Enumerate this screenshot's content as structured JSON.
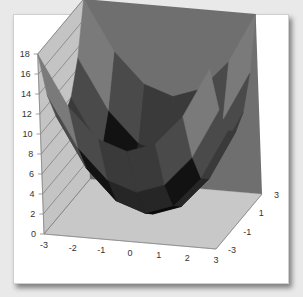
{
  "chart_data": {
    "type": "surface",
    "title": "",
    "function": "z = x^2 + y^2",
    "x": [
      -3,
      -2,
      -1,
      0,
      1,
      2,
      3
    ],
    "y": [
      -3,
      -2,
      -1,
      0,
      1,
      2,
      3
    ],
    "z": [
      [
        18,
        13,
        10,
        9,
        10,
        13,
        18
      ],
      [
        13,
        8,
        5,
        4,
        5,
        8,
        13
      ],
      [
        10,
        5,
        2,
        1,
        2,
        5,
        10
      ],
      [
        9,
        4,
        1,
        0,
        1,
        4,
        9
      ],
      [
        10,
        5,
        2,
        1,
        2,
        5,
        10
      ],
      [
        13,
        8,
        5,
        4,
        5,
        8,
        13
      ],
      [
        18,
        13,
        10,
        9,
        10,
        13,
        18
      ]
    ],
    "z_axis": {
      "min": 0,
      "max": 18,
      "step": 2,
      "tick_labels": [
        "0",
        "2",
        "4",
        "6",
        "8",
        "10",
        "12",
        "14",
        "16",
        "18"
      ]
    },
    "x_axis": {
      "tick_labels": [
        "-3",
        "-2",
        "-1",
        "0",
        "1",
        "2",
        "3"
      ]
    },
    "depth_axis": {
      "tick_labels": [
        "-3",
        "-1",
        "1",
        "3"
      ]
    },
    "band_colors": [
      "#0a0a0a",
      "#262626",
      "#121212",
      "#3a3a3a",
      "#4a4a4a",
      "#5c5c5c",
      "#7a7a7a",
      "#9a9a9a",
      "#b8b8b8"
    ],
    "wall_colors": {
      "side": "#c4c4c4",
      "back": "#6f6f6f",
      "floor": "#c8c8c8"
    },
    "grid": true,
    "legend": "none"
  }
}
